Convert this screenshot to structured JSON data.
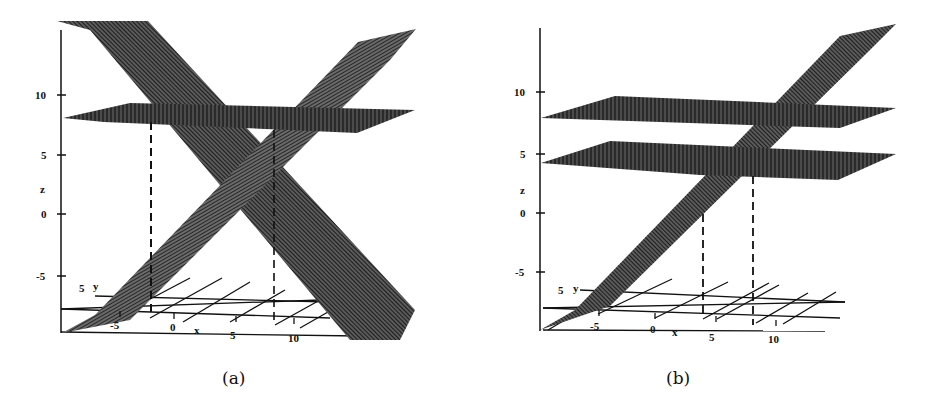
{
  "figure": {
    "panels": [
      {
        "id": "a",
        "caption": "(a)",
        "z_axis": {
          "label": "z",
          "ticks": [
            "10",
            "5",
            "0",
            "-5"
          ]
        },
        "x_axis": {
          "label": "x",
          "ticks": [
            "-5",
            "0",
            "5",
            "10"
          ]
        },
        "y_axis": {
          "label": "y",
          "ticks": [
            "5"
          ]
        },
        "description": "Two intersecting tilted planes forming an X shape, crossed by one horizontal plane near z=8, with two dashed vertical projection lines down to the x-y floor grid."
      },
      {
        "id": "b",
        "caption": "(b)",
        "z_axis": {
          "label": "z",
          "ticks": [
            "10",
            "5",
            "0",
            "-5"
          ]
        },
        "x_axis": {
          "label": "x",
          "ticks": [
            "-5",
            "0",
            "5",
            "10"
          ]
        },
        "y_axis": {
          "label": "y",
          "ticks": [
            "5"
          ]
        },
        "description": "One tilted plane rising left to right, crossed by two horizontal planes near z=8 and z=4, with two dashed vertical projection lines down to the x-y floor grid."
      }
    ]
  },
  "colors": {
    "ink": "#111111",
    "plane_fill": "#3a3a3a",
    "background": "#ffffff"
  }
}
